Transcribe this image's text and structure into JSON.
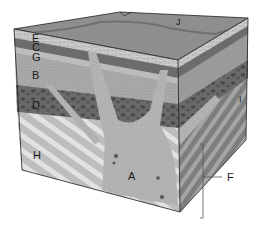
{
  "diagram": {
    "type": "geologic-block-diagram",
    "labels": {
      "E": "E",
      "C": "C",
      "G": "G",
      "B": "B",
      "D": "D",
      "H": "H",
      "A": "A",
      "I": "I",
      "F": "F",
      "J": "J"
    },
    "colors": {
      "top_surface": "#8c8c8c",
      "limestone": "#c8c8c8",
      "dark_band": "#6e6e6e",
      "sandstone": "#a8a8a8",
      "conglomerate": "#5a5a5a",
      "intrusion": "#b4b4b4",
      "striped_light": "#d8d8d8",
      "striped_dark": "#8a8a8a",
      "outline": "#222222"
    }
  }
}
